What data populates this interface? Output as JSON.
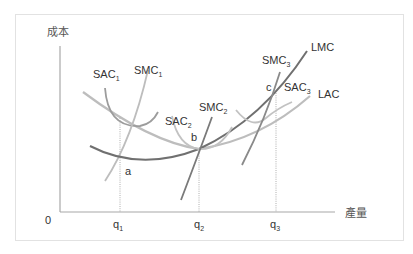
{
  "diagram": {
    "title": "",
    "y_axis_label": "成本",
    "x_axis_label": "產量",
    "origin_label": "0",
    "x_ticks": [
      {
        "base": "q",
        "sub": "1"
      },
      {
        "base": "q",
        "sub": "2"
      },
      {
        "base": "q",
        "sub": "3"
      }
    ],
    "curves": [
      {
        "name": "LMC",
        "base": "LMC",
        "sub": ""
      },
      {
        "name": "LAC",
        "base": "LAC",
        "sub": ""
      },
      {
        "name": "SAC1",
        "base": "SAC",
        "sub": "1"
      },
      {
        "name": "SMC1",
        "base": "SMC",
        "sub": "1"
      },
      {
        "name": "SAC2",
        "base": "SAC",
        "sub": "2"
      },
      {
        "name": "SMC2",
        "base": "SMC",
        "sub": "2"
      },
      {
        "name": "SAC3",
        "base": "SAC",
        "sub": "3"
      },
      {
        "name": "SMC3",
        "base": "SMC",
        "sub": "3"
      }
    ],
    "points": [
      {
        "label": "a"
      },
      {
        "label": "b"
      },
      {
        "label": "c"
      }
    ],
    "colors": {
      "axis": "#9a9a9a",
      "dark_curve": "#6e6e6e",
      "mid_curve": "#8f8f8f",
      "light_curve": "#bdbdbd",
      "guide": "#9a9a9a",
      "text": "#333333"
    }
  }
}
